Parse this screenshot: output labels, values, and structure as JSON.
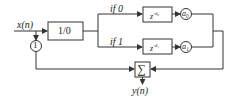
{
  "diagram": {
    "input_label": "x(n)",
    "output_label": "y(n)",
    "selector_block": "1/0",
    "feedback_node": "1",
    "branches": [
      {
        "condition": "if  0",
        "delay_block": "z",
        "delay_exp": "-d₀",
        "gain": "a₀"
      },
      {
        "condition": "if  1",
        "delay_block": "z",
        "delay_exp": "-d₁",
        "gain": "a₁"
      }
    ],
    "summer_symbol": "∑"
  },
  "colors": {
    "line": "#333333",
    "background": "#ffffff"
  }
}
